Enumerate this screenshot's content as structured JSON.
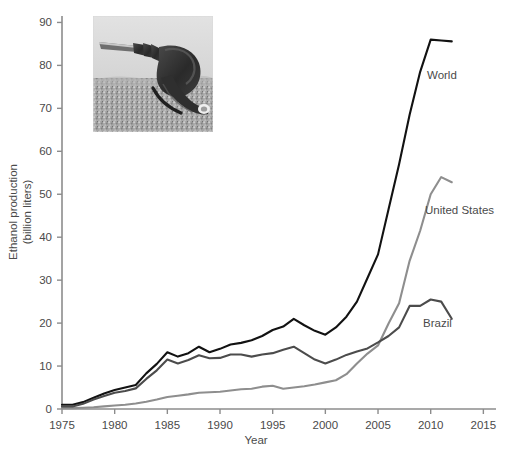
{
  "figure": {
    "background_color": "#ffffff",
    "axis_color": "#8c8c8c",
    "text_color": "#4a4a4a"
  },
  "inset_photo": {
    "name": "fuel-nozzle-on-grain-photo",
    "description": "Black and white photograph of a fuel pump nozzle resting on a pile of grain kernels",
    "alt": "Fuel nozzle on grain"
  },
  "axes": {
    "x": {
      "label": "Year",
      "ticks": [
        1975,
        1980,
        1985,
        1990,
        1995,
        2000,
        2005,
        2010,
        2015
      ],
      "tick_labels": [
        "1975",
        "1980",
        "1985",
        "1990",
        "1995",
        "2000",
        "2005",
        "2010",
        "2015"
      ],
      "min": 1975,
      "max": 2016.2
    },
    "y": {
      "label_line1": "Ethanol production",
      "label_line2": "(billion liters)",
      "ticks": [
        0,
        10,
        20,
        30,
        40,
        50,
        60,
        70,
        80,
        90
      ],
      "tick_labels": [
        "0",
        "10",
        "20",
        "30",
        "40",
        "50",
        "60",
        "70",
        "80",
        "90"
      ],
      "min": 0,
      "max": 91.5
    }
  },
  "series_labels": {
    "world": "World",
    "united_states": "United States",
    "brazil": "Brazil"
  },
  "chart_data": {
    "type": "line",
    "title": "",
    "xlabel": "Year",
    "ylabel": "Ethanol production (billion liters)",
    "xlim": [
      1975,
      2016.2
    ],
    "ylim": [
      0,
      91.5
    ],
    "grid": false,
    "legend_position": "inline-right-of-lines",
    "x": [
      1975,
      1976,
      1977,
      1978,
      1979,
      1980,
      1981,
      1982,
      1983,
      1984,
      1985,
      1986,
      1987,
      1988,
      1989,
      1990,
      1991,
      1992,
      1993,
      1994,
      1995,
      1996,
      1997,
      1998,
      1999,
      2000,
      2001,
      2002,
      2003,
      2004,
      2005,
      2006,
      2007,
      2008,
      2009,
      2010,
      2011,
      2012
    ],
    "series": [
      {
        "name": "World",
        "color": "#121212",
        "linewidth": 2.1,
        "values": [
          1.0,
          1.0,
          1.6,
          2.6,
          3.6,
          4.4,
          5.0,
          5.6,
          8.3,
          10.5,
          13.2,
          12.2,
          13.0,
          14.5,
          13.2,
          14.0,
          15.0,
          15.4,
          16.0,
          17.0,
          18.4,
          19.2,
          21.0,
          19.5,
          18.2,
          17.3,
          19.0,
          21.5,
          25.0,
          30.5,
          36.0,
          46.5,
          57.0,
          68.5,
          78.5,
          86.0,
          85.8,
          85.6
        ]
      },
      {
        "name": "United States",
        "color": "#8e8e8e",
        "linewidth": 2.1,
        "values": [
          0.2,
          0.2,
          0.3,
          0.4,
          0.6,
          0.8,
          1.0,
          1.3,
          1.7,
          2.2,
          2.8,
          3.1,
          3.4,
          3.8,
          3.9,
          4.0,
          4.3,
          4.6,
          4.7,
          5.2,
          5.4,
          4.7,
          5.0,
          5.3,
          5.7,
          6.2,
          6.7,
          8.1,
          10.6,
          12.9,
          14.8,
          19.9,
          24.6,
          34.5,
          41.5,
          50.0,
          54.0,
          52.8
        ]
      },
      {
        "name": "Brazil",
        "color": "#4c4c4c",
        "linewidth": 2.1,
        "values": [
          0.6,
          0.6,
          1.2,
          2.2,
          3.0,
          3.8,
          4.2,
          4.8,
          7.0,
          9.0,
          11.5,
          10.6,
          11.4,
          12.5,
          11.8,
          11.9,
          12.7,
          12.7,
          12.2,
          12.7,
          13.0,
          13.8,
          14.5,
          13.0,
          11.5,
          10.6,
          11.5,
          12.6,
          13.4,
          14.1,
          15.5,
          17.0,
          19.0,
          24.0,
          24.0,
          25.5,
          25.0,
          21.0
        ]
      }
    ],
    "annotations": [
      {
        "text": "World",
        "x": 2012.5,
        "y": 74.0
      },
      {
        "text": "United States",
        "x": 2012.0,
        "y": 43.0
      },
      {
        "text": "Brazil",
        "x": 2011.5,
        "y": 17.5
      }
    ]
  }
}
